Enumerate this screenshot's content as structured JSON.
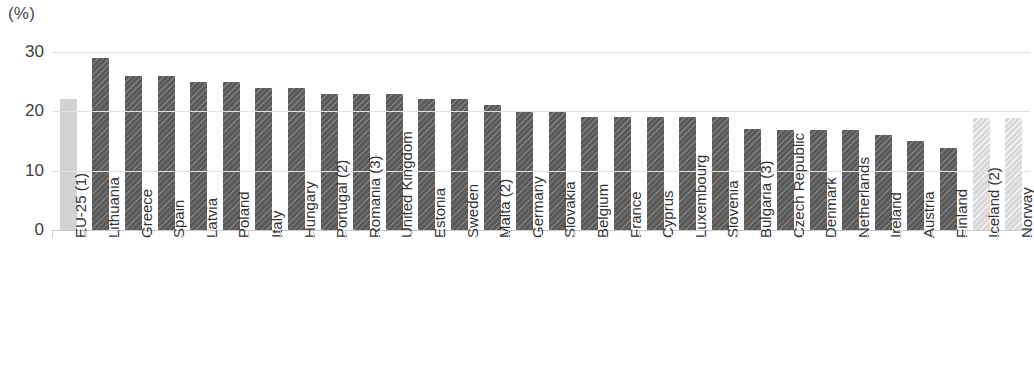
{
  "chart_data": {
    "type": "bar",
    "title": "",
    "subtitle": "",
    "unit_label": "(%)",
    "xlabel": "",
    "ylabel": "",
    "ylim": [
      0,
      30
    ],
    "yticks": [
      0,
      10,
      20,
      30
    ],
    "ytick_labels": [
      "0",
      "10",
      "20",
      "30"
    ],
    "grid": true,
    "grid_axis": "y",
    "legend": "none",
    "categories": [
      "EU-25 (1)",
      "Lithuania",
      "Greece",
      "Spain",
      "Latvia",
      "Poland",
      "Italy",
      "Hungary",
      "Portugal (2)",
      "Romania (3)",
      "United Kingdom",
      "Estonia",
      "Sweden",
      "Malta (2)",
      "Germany",
      "Slovakia",
      "Belgium",
      "France",
      "Cyprus",
      "Luxembourg",
      "Slovenia",
      "Bulgaria (3)",
      "Czech Republic",
      "Denmark",
      "Netherlands",
      "Ireland",
      "Austria",
      "Finland",
      "Iceland (2)",
      "Norway"
    ],
    "values": [
      22.0,
      29.0,
      26.0,
      26.0,
      25.0,
      25.0,
      24.0,
      24.0,
      23.0,
      23.0,
      23.0,
      22.0,
      22.0,
      21.0,
      20.0,
      20.0,
      19.0,
      19.0,
      19.0,
      19.0,
      19.0,
      17.0,
      16.8,
      16.8,
      16.8,
      16.0,
      15.0,
      13.8,
      18.8,
      18.8
    ],
    "bar_styles": [
      "light-solid",
      "dark",
      "dark",
      "dark",
      "dark",
      "dark",
      "dark",
      "dark",
      "dark",
      "dark",
      "dark",
      "dark",
      "dark",
      "dark",
      "dark",
      "dark",
      "dark",
      "dark",
      "dark",
      "dark",
      "dark",
      "dark",
      "dark",
      "dark",
      "dark",
      "dark",
      "dark",
      "dark",
      "light-hatch",
      "light-hatch"
    ],
    "colors": {
      "bar_dark": "#5a5a5a",
      "bar_light_solid": "#d2d2d2",
      "bar_light_hatch": "#d9d9d9",
      "gridline": "#e2e2e2",
      "axis": "#c9c9c9",
      "text": "#333333"
    }
  }
}
